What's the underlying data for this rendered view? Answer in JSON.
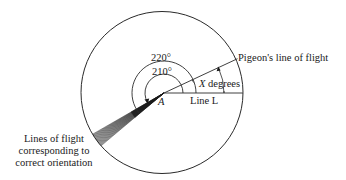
{
  "diagram": {
    "colors": {
      "stroke": "#2a2a2a",
      "fan": "#1a1a1a",
      "text": "#1a1a1a"
    },
    "labels": {
      "angle_outer": "220°",
      "angle_inner": "210°",
      "point": "A",
      "line_l": "Line L",
      "x_degrees_var": "X",
      "x_degrees_unit": " degrees",
      "pigeon_line": "Pigeon's line of flight",
      "fan_caption_1": "Lines of flight",
      "fan_caption_2": "corresponding to",
      "fan_caption_3": "correct orientation"
    },
    "geometry": {
      "circle_center": [
        162,
        92.5
      ],
      "circle_radius": 81,
      "point_a": [
        164,
        93
      ],
      "pigeon_angle_deg": 25,
      "fan_start_deg": 210,
      "fan_end_deg": 220
    }
  }
}
